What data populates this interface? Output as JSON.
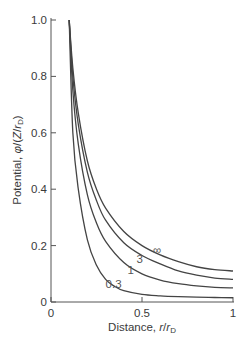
{
  "chart_data": {
    "type": "line",
    "title": "",
    "xlabel": "Distance, r/r_D",
    "ylabel": "Potential, φ/(Z/r_D)",
    "xlim": [
      0,
      1
    ],
    "ylim": [
      0,
      1.0
    ],
    "x_ticks": [
      "0",
      "0.5",
      "1"
    ],
    "y_ticks": [
      "0",
      "0.2",
      "0.4",
      "0.6",
      "0.8",
      "1.0"
    ],
    "grid": false,
    "legend": "inline curve labels",
    "series": [
      {
        "name": "∞",
        "x": [
          0.1,
          0.12,
          0.15,
          0.2,
          0.25,
          0.3,
          0.4,
          0.5,
          0.6,
          0.7,
          0.8,
          0.9,
          1.0
        ],
        "y": [
          1.0,
          0.83,
          0.67,
          0.5,
          0.4,
          0.333,
          0.25,
          0.2,
          0.167,
          0.143,
          0.125,
          0.115,
          0.11
        ]
      },
      {
        "name": "3",
        "x": [
          0.1,
          0.12,
          0.15,
          0.2,
          0.25,
          0.3,
          0.4,
          0.5,
          0.6,
          0.7,
          0.8,
          0.9,
          1.0
        ],
        "y": [
          1.0,
          0.8,
          0.63,
          0.46,
          0.36,
          0.29,
          0.21,
          0.165,
          0.135,
          0.11,
          0.095,
          0.085,
          0.08
        ]
      },
      {
        "name": "1",
        "x": [
          0.1,
          0.12,
          0.15,
          0.2,
          0.25,
          0.3,
          0.4,
          0.5,
          0.6,
          0.7,
          0.8,
          0.9,
          1.0
        ],
        "y": [
          1.0,
          0.75,
          0.56,
          0.38,
          0.28,
          0.215,
          0.14,
          0.1,
          0.078,
          0.065,
          0.057,
          0.052,
          0.05
        ]
      },
      {
        "name": "0.3",
        "x": [
          0.1,
          0.12,
          0.15,
          0.2,
          0.25,
          0.3,
          0.35,
          0.4,
          0.5,
          0.6,
          0.7,
          0.8,
          0.9,
          1.0
        ],
        "y": [
          1.0,
          0.6,
          0.4,
          0.22,
          0.13,
          0.08,
          0.055,
          0.04,
          0.027,
          0.022,
          0.019,
          0.017,
          0.016,
          0.015
        ]
      }
    ],
    "annotations": [
      {
        "text": "∞",
        "x": 0.56,
        "y": 0.17
      },
      {
        "text": "3",
        "x": 0.47,
        "y": 0.14
      },
      {
        "text": "1",
        "x": 0.42,
        "y": 0.1
      },
      {
        "text": "0.3",
        "x": 0.3,
        "y": 0.05
      }
    ]
  },
  "labels": {
    "xlabel_main": "Distance, ",
    "xlabel_var": "r",
    "xlabel_slash": "/",
    "xlabel_var2": "r",
    "xlabel_sub": "D",
    "ylabel_main": "Potential, ",
    "ylabel_var": "φ",
    "ylabel_rest": "/(",
    "ylabel_z": "Z",
    "ylabel_slash": "/",
    "ylabel_r": "r",
    "ylabel_sub": "D",
    "ylabel_close": ")"
  }
}
